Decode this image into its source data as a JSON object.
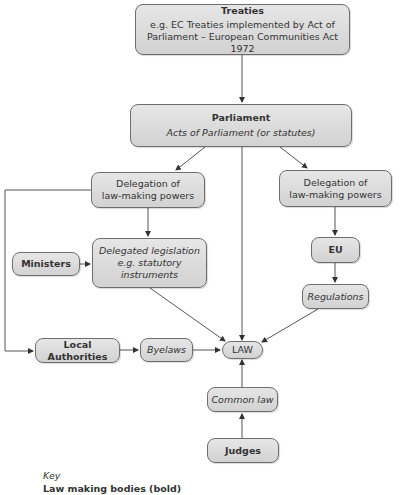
{
  "diagram": {
    "nodes": {
      "treaties": {
        "title": "Treaties",
        "line1": "e.g. EC Treaties implemented by Act of",
        "line2": "Parliament – European Communities Act 1972"
      },
      "parliament": {
        "title": "Parliament",
        "subtitle": "Acts of Parliament (or statutes)"
      },
      "delegation_left": {
        "line1": "Delegation of",
        "line2": "law-making powers"
      },
      "delegation_right": {
        "line1": "Delegation of",
        "line2": "law-making powers"
      },
      "ministers": {
        "label": "Ministers"
      },
      "delegated_legislation": {
        "line1": "Delegated legislation",
        "line2": "e.g. statutory",
        "line3": "instruments"
      },
      "eu": {
        "label": "EU"
      },
      "regulations": {
        "label": "Regulations"
      },
      "local_authorities": {
        "label": "Local Authorities"
      },
      "byelaws": {
        "label": "Byelaws"
      },
      "law": {
        "label": "LAW"
      },
      "common_law": {
        "label": "Common law"
      },
      "judges": {
        "label": "Judges"
      }
    },
    "edges": [
      [
        "treaties",
        "parliament"
      ],
      [
        "parliament",
        "delegation_left"
      ],
      [
        "parliament",
        "law"
      ],
      [
        "parliament",
        "delegation_right"
      ],
      [
        "delegation_left",
        "delegated_legislation"
      ],
      [
        "delegation_left",
        "local_authorities"
      ],
      [
        "ministers",
        "delegated_legislation"
      ],
      [
        "delegated_legislation",
        "law"
      ],
      [
        "delegation_right",
        "eu"
      ],
      [
        "eu",
        "regulations"
      ],
      [
        "regulations",
        "law"
      ],
      [
        "local_authorities",
        "byelaws"
      ],
      [
        "byelaws",
        "law"
      ],
      [
        "common_law",
        "law"
      ],
      [
        "judges",
        "common_law"
      ]
    ],
    "key": {
      "heading": "Key",
      "item": "Law making bodies (bold)"
    }
  },
  "colors": {
    "box_fill_top": "#e6e6e6",
    "box_fill_bottom": "#d2d2d2",
    "border": "#6e6e6e",
    "line": "#555555",
    "text": "#333333"
  }
}
